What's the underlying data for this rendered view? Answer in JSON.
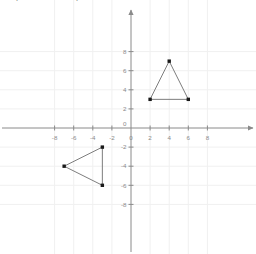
{
  "figure": {
    "title_fragment": "p",
    "background_color": "#ffffff",
    "axis_color": "#8a8a8a",
    "grid_color": "#f0f0f0",
    "shape_line_color": "#6e6e6e",
    "point_color": "#1a1a1a",
    "label_color": "#3a3a3a",
    "tick_label_color": "#8a8a8a"
  },
  "chart_data": {
    "type": "scatter",
    "title": "",
    "xlabel": "",
    "ylabel": "",
    "xlim": [
      -9.8,
      9.2
    ],
    "ylim": [
      -9.2,
      9.4
    ],
    "grid": true,
    "legend": "none",
    "x_ticks": [
      -8,
      -6,
      -4,
      -2,
      0,
      2,
      4,
      6,
      8
    ],
    "y_ticks": [
      8,
      6,
      4,
      2,
      0,
      -2,
      -4,
      -6,
      -8
    ],
    "x_tick_labels": [
      "-8",
      "-6",
      "-4",
      "-2",
      "0",
      "2",
      "4",
      "6",
      "8"
    ],
    "y_tick_labels": [
      "8",
      "6",
      "4",
      "2",
      "0",
      "-2",
      "-4",
      "-6",
      "-8"
    ],
    "origin_label": "0",
    "shapes": [
      {
        "name": "triangle-abc",
        "closed": true,
        "vertices": [
          {
            "label": "A",
            "x": 2,
            "y": 3,
            "label_pos": "left"
          },
          {
            "label": "B",
            "x": 4,
            "y": 7,
            "label_pos": "above"
          },
          {
            "label": "C",
            "x": 6,
            "y": 3,
            "label_pos": "right"
          }
        ]
      },
      {
        "name": "triangle-image",
        "closed": true,
        "vertices": [
          {
            "label": "",
            "x": -3,
            "y": -2,
            "label_pos": "none"
          },
          {
            "label": "",
            "x": -7,
            "y": -4,
            "label_pos": "none"
          },
          {
            "label": "",
            "x": -3,
            "y": -6,
            "label_pos": "none"
          }
        ]
      }
    ]
  }
}
